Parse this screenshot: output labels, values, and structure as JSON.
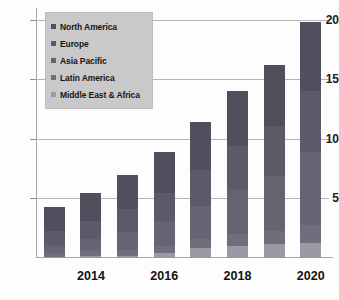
{
  "chart_data": {
    "type": "bar",
    "subtype": "stacked-bar",
    "title": "",
    "xlabel": "",
    "ylabel": "",
    "categories": [
      "2013",
      "2014",
      "2015",
      "2016",
      "2017",
      "2018",
      "2019",
      "2020"
    ],
    "visible_tick_labels": [
      "2014",
      "2016",
      "2018",
      "2020"
    ],
    "ylim": [
      0,
      21
    ],
    "yticks": [
      5,
      10,
      15,
      20
    ],
    "ytick_labels": [
      "5",
      "10",
      "15",
      "20"
    ],
    "grid": true,
    "legend_position": "top-left",
    "series": [
      {
        "name": "North America",
        "color": "#4f4f5e",
        "values": [
          2.0,
          2.4,
          2.9,
          3.4,
          4.0,
          4.6,
          5.1,
          5.8
        ]
      },
      {
        "name": "Europe",
        "color": "#5a5a68",
        "values": [
          1.2,
          1.5,
          1.9,
          2.4,
          3.0,
          3.6,
          4.2,
          5.1
        ]
      },
      {
        "name": "Asia Pacific",
        "color": "#646472",
        "values": [
          0.7,
          1.0,
          1.5,
          2.1,
          2.8,
          3.8,
          4.6,
          6.1
        ]
      },
      {
        "name": "Latin America",
        "color": "#6e6e7c",
        "values": [
          0.3,
          0.4,
          0.5,
          0.6,
          0.8,
          1.0,
          1.1,
          1.5
        ]
      },
      {
        "name": "Middle East & Africa",
        "color": "#9a9aa4",
        "values": [
          0.1,
          0.2,
          0.2,
          0.4,
          0.8,
          1.0,
          1.2,
          1.3
        ]
      }
    ],
    "totals": [
      4.3,
      5.5,
      7.0,
      8.9,
      11.4,
      14.0,
      16.2,
      19.8
    ]
  },
  "legend": {
    "items": [
      {
        "label": "North America"
      },
      {
        "label": "Europe"
      },
      {
        "label": "Asia Pacific"
      },
      {
        "label": "Latin America"
      },
      {
        "label": "Middle East & Africa"
      }
    ]
  }
}
